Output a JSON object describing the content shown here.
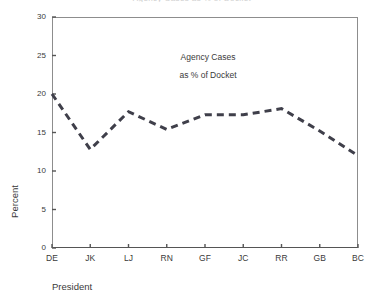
{
  "figure": {
    "clipped_title": "Agency Cases as % of Docket",
    "background_color": "#ffffff",
    "frame_color": "#8d8d8d",
    "line_color": "#3f3f4a"
  },
  "annotation": {
    "line1": "Agency Cases",
    "line2": "as % of Docket"
  },
  "chart_data": {
    "type": "line",
    "title": "",
    "subtitle": "",
    "xlabel": "President",
    "ylabel": "Percent",
    "categories": [
      "DE",
      "JK",
      "LJ",
      "RN",
      "GF",
      "JC",
      "RR",
      "GB",
      "BC"
    ],
    "values": [
      20.0,
      12.8,
      17.7,
      15.4,
      17.3,
      17.3,
      18.1,
      15.2,
      12.0
    ],
    "series": [
      {
        "name": "Agency Cases as % of Docket",
        "values": [
          20.0,
          12.8,
          17.7,
          15.4,
          17.3,
          17.3,
          18.1,
          15.2,
          12.0
        ],
        "style": "dashed",
        "color": "#3f3f4a",
        "width": 3
      }
    ],
    "ylim": [
      0,
      30
    ],
    "yticks": [
      0,
      5,
      10,
      15,
      20,
      25,
      30
    ],
    "ytick_labels": [
      "0",
      "5",
      "10",
      "15",
      "20",
      "25",
      "30"
    ],
    "xtick_labels": [
      "DE",
      "JK",
      "LJ",
      "RN",
      "GF",
      "JC",
      "RR",
      "GB",
      "BC"
    ],
    "grid": false,
    "legend": null,
    "annotations": [
      "Agency Cases",
      "as % of Docket"
    ],
    "markers": false
  }
}
